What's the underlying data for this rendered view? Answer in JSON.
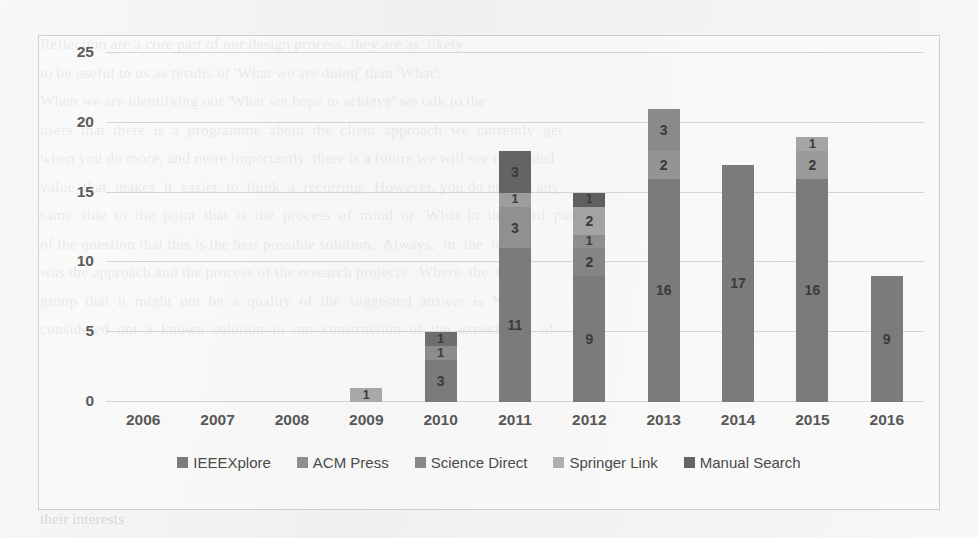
{
  "chart_data": {
    "type": "bar",
    "stacked": true,
    "title": "",
    "xlabel": "",
    "ylabel": "",
    "categories": [
      "2006",
      "2007",
      "2008",
      "2009",
      "2010",
      "2011",
      "2012",
      "2013",
      "2014",
      "2015",
      "2016"
    ],
    "ylim": [
      0,
      25
    ],
    "yticks": [
      0,
      5,
      10,
      15,
      20,
      25
    ],
    "grid": true,
    "legend_position": "bottom",
    "series": [
      {
        "name": "IEEEXplore",
        "color": "#7b7b7b",
        "values": [
          null,
          null,
          null,
          null,
          3,
          11,
          9,
          16,
          17,
          16,
          9
        ]
      },
      {
        "name": "ACM Press",
        "color": "#8e8e8e",
        "values": [
          null,
          null,
          null,
          null,
          null,
          null,
          2,
          null,
          null,
          null,
          null
        ]
      },
      {
        "name": "Science Direct",
        "color": "#888888",
        "values": [
          null,
          null,
          null,
          null,
          1,
          3,
          1,
          2,
          null,
          2,
          null
        ]
      },
      {
        "name": "Springer Link",
        "color": "#a8a8a8",
        "values": [
          null,
          null,
          null,
          1,
          1,
          1,
          2,
          null,
          null,
          1,
          null
        ]
      },
      {
        "name": "Manual Search",
        "color": "#646464",
        "values": [
          null,
          null,
          null,
          null,
          null,
          3,
          1,
          3,
          null,
          null,
          null
        ]
      }
    ],
    "totals": [
      0,
      0,
      0,
      1,
      5,
      18,
      15,
      21,
      17,
      19,
      9
    ],
    "bar_stacks": [
      {
        "category": "2006",
        "segments": []
      },
      {
        "category": "2007",
        "segments": []
      },
      {
        "category": "2008",
        "segments": []
      },
      {
        "category": "2009",
        "segments": [
          {
            "series": "Springer Link",
            "value": 1,
            "label": "1",
            "color": "#a8a8a8"
          }
        ]
      },
      {
        "category": "2010",
        "segments": [
          {
            "series": "IEEEXplore",
            "value": 3,
            "label": "3",
            "color": "#7b7b7b"
          },
          {
            "series": "Science Direct",
            "value": 1,
            "label": "1",
            "color": "#8c8c8c"
          },
          {
            "series": "Springer Link",
            "value": 1,
            "label": "1",
            "color": "#6e6e6e"
          }
        ]
      },
      {
        "category": "2011",
        "segments": [
          {
            "series": "IEEEXplore",
            "value": 11,
            "label": "11",
            "color": "#7b7b7b"
          },
          {
            "series": "Science Direct",
            "value": 3,
            "label": "3",
            "color": "#909090"
          },
          {
            "series": "Springer Link",
            "value": 1,
            "label": "1",
            "color": "#9d9d9d"
          },
          {
            "series": "Manual Search",
            "value": 3,
            "label": "3",
            "color": "#646464"
          }
        ]
      },
      {
        "category": "2012",
        "segments": [
          {
            "series": "IEEEXplore",
            "value": 9,
            "label": "9",
            "color": "#7b7b7b"
          },
          {
            "series": "ACM Press",
            "value": 2,
            "label": "2",
            "color": "#858585"
          },
          {
            "series": "Science Direct",
            "value": 1,
            "label": "1",
            "color": "#8e8e8e"
          },
          {
            "series": "Springer Link",
            "value": 2,
            "label": "2",
            "color": "#a3a3a3"
          },
          {
            "series": "Manual Search",
            "value": 1,
            "label": "1",
            "color": "#5f5f5f"
          }
        ]
      },
      {
        "category": "2013",
        "segments": [
          {
            "series": "IEEEXplore",
            "value": 16,
            "label": "16",
            "color": "#7b7b7b"
          },
          {
            "series": "Science Direct",
            "value": 2,
            "label": "2",
            "color": "#949494"
          },
          {
            "series": "Manual Search",
            "value": 3,
            "label": "3",
            "color": "#8a8a8a"
          }
        ]
      },
      {
        "category": "2014",
        "segments": [
          {
            "series": "IEEEXplore",
            "value": 17,
            "label": "17",
            "color": "#7b7b7b"
          }
        ]
      },
      {
        "category": "2015",
        "segments": [
          {
            "series": "IEEEXplore",
            "value": 16,
            "label": "16",
            "color": "#7b7b7b"
          },
          {
            "series": "Science Direct",
            "value": 2,
            "label": "2",
            "color": "#9a9a9a"
          },
          {
            "series": "Springer Link",
            "value": 1,
            "label": "1",
            "color": "#a5a5a5"
          }
        ]
      },
      {
        "category": "2016",
        "segments": [
          {
            "series": "IEEEXplore",
            "value": 9,
            "label": "9",
            "color": "#7b7b7b"
          }
        ]
      }
    ]
  },
  "legend": {
    "items": [
      {
        "label": "IEEEXplore",
        "color": "#7b7b7b"
      },
      {
        "label": "ACM Press",
        "color": "#8e8e8e"
      },
      {
        "label": "Science Direct",
        "color": "#888888"
      },
      {
        "label": "Springer Link",
        "color": "#aeaeae"
      },
      {
        "label": "Manual Search",
        "color": "#646464"
      }
    ]
  },
  "background_text": {
    "top": "Reflection are a core part of our design process, they are as  likely\nto be useful to us as results of 'What we are doing' than 'What'.\nWhen we are identifying our 'What we hope to achieve' we talk to the\nusers  that  there  is  a  programme  about  the  client  approach  we  currently  get\nwhen you do more, and more importantly, there is a future we will see the added\nvalue  that  makes  it  easier  to  think  a  recurring.  However, you do not see any\nsame  side  to  the  point  that  is  the  process  of  mind  or  'What' in  the  third  part\nof the question that this is the best possible solution.  Always,  in  the  topic\nwas the approach and the process of the research projects.  Where  the  topic\ngroup  that  it  might  not  be  a  quality  of  the  suggested  answer  is  NOT\nconsidered  not  a  known  solution  in  our  construction  of  the  expectation  of",
    "bottom": "their interests"
  }
}
